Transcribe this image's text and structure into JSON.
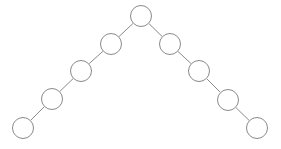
{
  "diagram": {
    "type": "node-link-graph",
    "title": "",
    "canvas": {
      "width": 281,
      "height": 149,
      "background": "#ffffff"
    },
    "style": {
      "node_fill": "#ffffff",
      "node_stroke": "#8a8a8a",
      "node_radius": 11,
      "edge_stroke": "#8a8a8a",
      "edge_width": 1
    },
    "nodes": [
      {
        "id": "n0",
        "name": "root-node",
        "label": "",
        "cx": 141,
        "cy": 16,
        "r": 11
      },
      {
        "id": "l1",
        "name": "left-node-1",
        "label": "",
        "cx": 111,
        "cy": 44,
        "r": 11
      },
      {
        "id": "l2",
        "name": "left-node-2",
        "label": "",
        "cx": 81,
        "cy": 71,
        "r": 11
      },
      {
        "id": "l3",
        "name": "left-node-3",
        "label": "",
        "cx": 52,
        "cy": 99,
        "r": 11
      },
      {
        "id": "l4",
        "name": "left-leaf-node",
        "label": "",
        "cx": 23,
        "cy": 128,
        "r": 11
      },
      {
        "id": "r1",
        "name": "right-node-1",
        "label": "",
        "cx": 170,
        "cy": 44,
        "r": 11
      },
      {
        "id": "r2",
        "name": "right-node-2",
        "label": "",
        "cx": 199,
        "cy": 71,
        "r": 11
      },
      {
        "id": "r3",
        "name": "right-node-3",
        "label": "",
        "cx": 228,
        "cy": 100,
        "r": 11
      },
      {
        "id": "r4",
        "name": "right-leaf-node",
        "label": "",
        "cx": 257,
        "cy": 128,
        "r": 11
      }
    ],
    "edges": [
      {
        "name": "edge-root-left-1",
        "from": "n0",
        "to": "l1"
      },
      {
        "name": "edge-left-1-left-2",
        "from": "l1",
        "to": "l2"
      },
      {
        "name": "edge-left-2-left-3",
        "from": "l2",
        "to": "l3"
      },
      {
        "name": "edge-left-3-left-leaf",
        "from": "l3",
        "to": "l4"
      },
      {
        "name": "edge-root-right-1",
        "from": "n0",
        "to": "r1"
      },
      {
        "name": "edge-right-1-right-2",
        "from": "r1",
        "to": "r2"
      },
      {
        "name": "edge-right-2-right-3",
        "from": "r2",
        "to": "r3"
      },
      {
        "name": "edge-right-3-right-leaf",
        "from": "r3",
        "to": "r4"
      }
    ]
  }
}
